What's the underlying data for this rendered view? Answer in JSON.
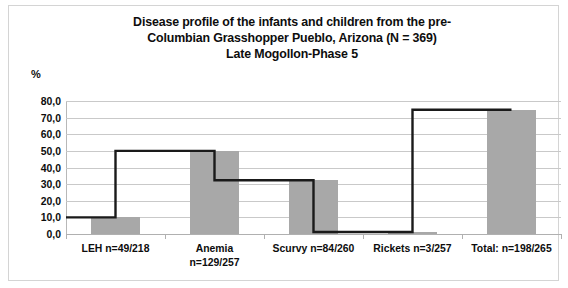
{
  "chart_data": {
    "type": "bar",
    "title_lines": [
      "Disease profile of the infants and children from the pre-",
      "Columbian Grasshopper Pueblo, Arizona (N = 369)",
      "Late Mogollon-Phase 5"
    ],
    "xlabel": "",
    "ylabel": "%",
    "ylim": [
      0,
      80
    ],
    "grid": true,
    "legend": "none",
    "ytick_labels": [
      "80,0",
      "70,0",
      "60,0",
      "50,0",
      "40,0",
      "30,0",
      "20,0",
      "10,0",
      "0,0"
    ],
    "ytick_values": [
      80,
      70,
      60,
      50,
      40,
      30,
      20,
      10,
      0
    ],
    "categories": [
      "LEH n=49/218",
      "Anemia n=129/257",
      "Scurvy n=84/260",
      "Rickets n=3/257",
      "Total: n=198/265"
    ],
    "category_label_lines": [
      [
        "LEH n=49/218"
      ],
      [
        "Anemia",
        "n=129/257"
      ],
      [
        "Scurvy n=84/260"
      ],
      [
        "Rickets n=3/257"
      ],
      [
        "Total: n=198/265"
      ]
    ],
    "values": [
      10.0,
      50.0,
      32.3,
      1.2,
      74.7
    ],
    "series": [
      {
        "name": "Prevalence",
        "values": [
          10.0,
          50.0,
          32.3,
          1.2,
          74.7
        ],
        "render": "bars-with-step-outline"
      }
    ],
    "colors": {
      "bar_fill": "#a8a8a8",
      "step_line": "#1a1a1a",
      "gridline": "#c9c9c9",
      "axis_line": "#b0b0b0",
      "text": "#0d0d0d",
      "frame_border": "#d4d4d4",
      "background": "#ffffff"
    }
  }
}
